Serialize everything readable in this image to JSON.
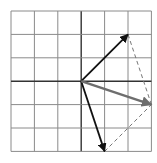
{
  "diagram": {
    "type": "vector-addition-parallelogram",
    "grid": {
      "cols": 6,
      "rows": 6,
      "left": 11,
      "top": 11,
      "cell": 23.4,
      "line_color": "#8a8a8a",
      "axis_color": "#333333"
    },
    "origin": {
      "gx": 3,
      "gy": 3
    },
    "vectors": [
      {
        "name": "vector-a",
        "dx": 2,
        "dy": 2,
        "color": "#111111",
        "width": 1.8,
        "dashed": false
      },
      {
        "name": "vector-b",
        "dx": 1,
        "dy": -3,
        "color": "#111111",
        "width": 1.8,
        "dashed": false
      },
      {
        "name": "vector-resultant",
        "dx": 3,
        "dy": -1,
        "color": "#6e6e6e",
        "width": 2.4,
        "dashed": false
      }
    ],
    "construction_lines": [
      {
        "name": "dashed-line-a-to-resultant",
        "from": [
          2,
          2
        ],
        "to": [
          3,
          -1
        ],
        "color": "#777777"
      },
      {
        "name": "dashed-line-b-to-resultant",
        "from": [
          1,
          -3
        ],
        "to": [
          3,
          -1
        ],
        "color": "#777777"
      }
    ]
  }
}
